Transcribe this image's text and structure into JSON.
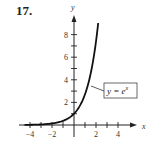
{
  "problem_number": "17.",
  "chart_data": {
    "type": "line",
    "title": "",
    "xlabel": "x",
    "ylabel": "y",
    "xlim": [
      -4.5,
      5.5
    ],
    "ylim": [
      -0.5,
      9.5
    ],
    "x_tick_labels": [
      "−4",
      "−2",
      "2",
      "4"
    ],
    "x_tick_values": [
      -4,
      -2,
      2,
      4
    ],
    "x_minor_ticks": [
      -4,
      -3,
      -2,
      -1,
      1,
      2,
      3,
      4
    ],
    "y_tick_labels": [
      "2",
      "4",
      "6",
      "8"
    ],
    "y_tick_values": [
      2,
      4,
      6,
      8
    ],
    "y_minor_ticks": [
      1,
      2,
      3,
      4,
      5,
      6,
      7,
      8
    ],
    "grid": false,
    "series": [
      {
        "name": "y = e^x",
        "function": "exp(x)",
        "x": [
          -4.5,
          -4,
          -3,
          -2,
          -1,
          0,
          0.5,
          1,
          1.5,
          2,
          2.2
        ],
        "y": [
          0.011,
          0.018,
          0.05,
          0.135,
          0.368,
          1,
          1.649,
          2.718,
          4.482,
          7.389,
          9.025
        ]
      }
    ],
    "annotations": [
      {
        "text": "y = e^x",
        "display": "y = e",
        "superscript": "x",
        "boxed": true,
        "points_to": [
          1.3,
          3.7
        ]
      }
    ]
  },
  "colors": {
    "curve": "#111111",
    "axis": "#222222",
    "box": "#444444"
  }
}
